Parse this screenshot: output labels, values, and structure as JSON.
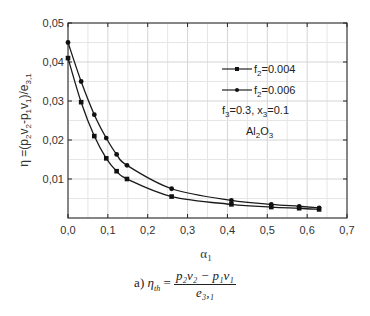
{
  "chart_data": {
    "type": "line",
    "title": "",
    "xlabel": "α1",
    "ylabel": "η =(p2v2-p1v1)/e3,1",
    "xlim": [
      0,
      0.7
    ],
    "ylim": [
      0,
      0.05
    ],
    "x_ticks": [
      "0,0",
      "0,1",
      "0,2",
      "0,3",
      "0,4",
      "0,5",
      "0,6",
      "0,7"
    ],
    "y_ticks": [
      "0,01",
      "0,02",
      "0,03",
      "0,04",
      "0,05"
    ],
    "grid": true,
    "legend_position": "upper right inside",
    "series": [
      {
        "name": "f2=0.004",
        "marker": "square",
        "x": [
          0.0,
          0.033,
          0.066,
          0.096,
          0.122,
          0.148,
          0.26,
          0.41,
          0.51,
          0.58,
          0.63
        ],
        "values": [
          0.041,
          0.0297,
          0.021,
          0.0153,
          0.012,
          0.01,
          0.0055,
          0.0035,
          0.0028,
          0.0025,
          0.0022
        ]
      },
      {
        "name": "f2=0.006",
        "marker": "circle",
        "x": [
          0.0,
          0.033,
          0.066,
          0.096,
          0.122,
          0.148,
          0.26,
          0.41,
          0.51,
          0.58,
          0.63
        ],
        "values": [
          0.045,
          0.035,
          0.0265,
          0.0205,
          0.0163,
          0.0135,
          0.0075,
          0.0045,
          0.0035,
          0.003,
          0.0026
        ]
      }
    ],
    "annotations": [
      "f3=0.3, x3=0.1",
      "Al2O3"
    ]
  },
  "legend": {
    "item1": {
      "prefix": "f",
      "sub": "2",
      "suffix": "=0.004"
    },
    "item2": {
      "prefix": "f",
      "sub": "2",
      "suffix": "=0.006"
    },
    "note1": {
      "a": "f",
      "a_sub": "3",
      "b": "=0.3, x",
      "b_sub": "3",
      "c": "=0.1"
    },
    "note2": {
      "a": "Al",
      "a_sub": "2",
      "b": "O",
      "b_sub": "3"
    }
  },
  "axes": {
    "ylabel_text": "η =(p",
    "xlabel_main": "α",
    "xlabel_sub": "1"
  },
  "caption": {
    "label": "a)",
    "lhs": "η",
    "lhs_sub": "th",
    "equals": "=",
    "numerator": "p₂v₂ − p₁v₁",
    "denominator": "e₃,₁"
  }
}
